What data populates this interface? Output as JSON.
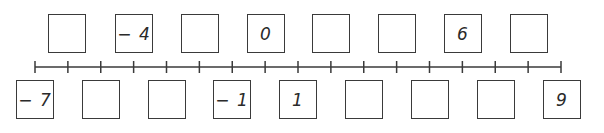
{
  "number_line": {
    "min": -7,
    "max": 9,
    "step": 1,
    "tick_count": 17,
    "line_color": "#3a3a3a"
  },
  "top_boxes": [
    {
      "position": -6,
      "value": ""
    },
    {
      "position": -4,
      "value": "-4"
    },
    {
      "position": -2,
      "value": ""
    },
    {
      "position": 0,
      "value": "0"
    },
    {
      "position": 2,
      "value": ""
    },
    {
      "position": 4,
      "value": ""
    },
    {
      "position": 6,
      "value": "6"
    },
    {
      "position": 8,
      "value": ""
    }
  ],
  "bottom_boxes": [
    {
      "position": -7,
      "value": "-7"
    },
    {
      "position": -5,
      "value": ""
    },
    {
      "position": -3,
      "value": ""
    },
    {
      "position": -1,
      "value": "-1"
    },
    {
      "position": 1,
      "value": "1"
    },
    {
      "position": 3,
      "value": ""
    },
    {
      "position": 5,
      "value": ""
    },
    {
      "position": 7,
      "value": ""
    },
    {
      "position": 9,
      "value": "9"
    }
  ]
}
